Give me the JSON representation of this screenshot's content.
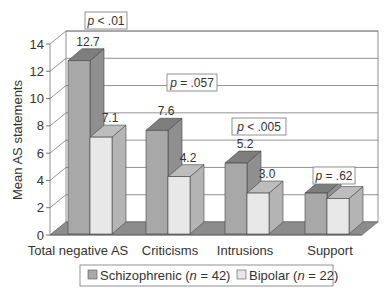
{
  "chart_data": {
    "type": "bar",
    "style": "3d-clustered",
    "title": "",
    "xlabel": "",
    "ylabel": "Mean AS statements",
    "ylim": [
      0,
      14
    ],
    "yticks": [
      0,
      2,
      4,
      6,
      8,
      10,
      12,
      14
    ],
    "grid": true,
    "legend_position": "bottom",
    "categories": [
      "Total negative AS",
      "Criticisms",
      "Intrusions",
      "Support"
    ],
    "series": [
      {
        "name": "Schizophrenic (n = 42)",
        "label_prefix": "Schizophrenic (",
        "n_italic": "n",
        "label_suffix": " = 42)",
        "values": [
          12.7,
          7.6,
          5.2,
          3.0
        ],
        "value_labels": [
          "12.7",
          "7.6",
          "5.2",
          "3.0"
        ],
        "color": "#a9a9a9"
      },
      {
        "name": "Bipolar (n = 22)",
        "label_prefix": "Bipolar (",
        "n_italic": "n",
        "label_suffix": " = 22)",
        "values": [
          7.1,
          4.2,
          3.0,
          2.6
        ],
        "value_labels": [
          "7.1",
          "4.2",
          "3.0",
          "2.6"
        ],
        "color": "#e6e6e6"
      }
    ],
    "annotations": [
      {
        "p_italic": "p",
        "text": " < .01",
        "category": "Total negative AS"
      },
      {
        "p_italic": "p",
        "text": " = .057",
        "category": "Criticisms"
      },
      {
        "p_italic": "p",
        "text": " < .005",
        "category": "Intrusions"
      },
      {
        "p_italic": "p",
        "text": " = .62",
        "category": "Support"
      }
    ]
  }
}
